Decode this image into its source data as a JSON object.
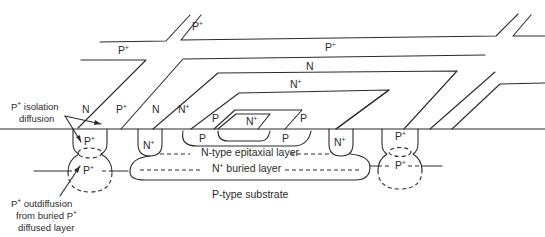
{
  "diagram": {
    "regions": {
      "top_left_pplus": "P",
      "top_mid_pplus": "P",
      "top_right_pplus": "P",
      "ring_n": "N",
      "ring_nplus": "N",
      "left_n": "N",
      "left_pplus": "P",
      "mid_n": "N",
      "mid_nplus": "N",
      "base_p_top_left": "P",
      "base_p_top_right": "P",
      "emitter_nplus": "N",
      "base_p_bottom_left": "P",
      "base_p_bottom_right": "P",
      "collector_contact_left": "N",
      "collector_contact_right": "N",
      "isolation_left_top": "P",
      "isolation_left_bottom": "P",
      "isolation_right_top": "P",
      "isolation_right_bottom": "P"
    },
    "superscript": "+",
    "layers": {
      "epitaxial": "N-type epitaxial layer",
      "buried_prefix": "N",
      "buried_suffix": " buried layer",
      "substrate": "P-type substrate"
    },
    "annotations": {
      "isolation": {
        "line1_prefix": "P",
        "line1_suffix": " isolation",
        "line2": "diffusion"
      },
      "outdiffusion": {
        "line1_prefix": "P",
        "line1_suffix": " outdiffusion",
        "line2_prefix": "from buried P",
        "line3": "diffused layer"
      }
    },
    "colors": {
      "stroke": "#2b2b2b",
      "background": "#ffffff"
    }
  }
}
